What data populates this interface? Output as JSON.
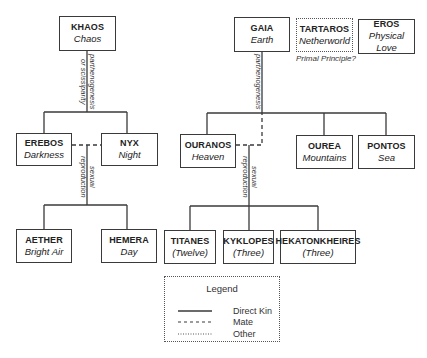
{
  "nodes": {
    "khaos": {
      "name": "KHAOS",
      "sub": "Chaos"
    },
    "gaia": {
      "name": "GAIA",
      "sub": "Earth"
    },
    "tartaros": {
      "name": "TARTAROS",
      "sub": "Netherworld"
    },
    "eros": {
      "name": "EROS",
      "sub": "Physical Love"
    },
    "erebos": {
      "name": "EREBOS",
      "sub": "Darkness"
    },
    "nyx": {
      "name": "NYX",
      "sub": "Night"
    },
    "ouranos": {
      "name": "OURANOS",
      "sub": "Heaven"
    },
    "ourea": {
      "name": "OUREA",
      "sub": "Mountains"
    },
    "pontos": {
      "name": "PONTOS",
      "sub": "Sea"
    },
    "aether": {
      "name": "AETHER",
      "sub": "Bright Air"
    },
    "hemera": {
      "name": "HEMERA",
      "sub": "Day"
    },
    "titanes": {
      "name": "TITANES",
      "sub": "(Twelve)"
    },
    "kyklopes": {
      "name": "KYKLOPES",
      "sub": "(Three)"
    },
    "hekatonkheires": {
      "name": "HEKATONKHEIRES",
      "sub": "(Three)"
    }
  },
  "notes": {
    "tartaros_note": "Primal Principle?"
  },
  "edge_labels": {
    "khaos_line1": "parthenogenesis",
    "khaos_line2": "or scissiparity",
    "gaia": "parthenogenesis",
    "erebos_nyx_line1": "sexual",
    "erebos_nyx_line2": "reproduction",
    "ouranos_gaia_line1": "sexual",
    "ouranos_gaia_line2": "reproduction"
  },
  "legend": {
    "title": "Legend",
    "items": [
      {
        "label": "Direct Kin",
        "style": "solid"
      },
      {
        "label": "Mate",
        "style": "dashed"
      },
      {
        "label": "Other",
        "style": "dotted"
      }
    ]
  }
}
